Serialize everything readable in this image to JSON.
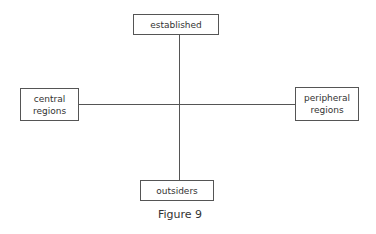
{
  "diagram": {
    "nodes": {
      "top": {
        "label": "established"
      },
      "left": {
        "label": "central\nregions"
      },
      "right": {
        "label": "peripheral\nregions"
      },
      "bottom": {
        "label": "outsiders"
      }
    },
    "edges": [
      {
        "from": "top",
        "to": "bottom",
        "orientation": "vertical"
      },
      {
        "from": "left",
        "to": "right",
        "orientation": "horizontal"
      }
    ],
    "caption": "Figure 9",
    "colors": {
      "line": "#555555",
      "text": "#333333",
      "background": "#ffffff"
    }
  }
}
